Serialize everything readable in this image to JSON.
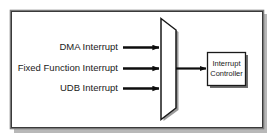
{
  "diagram": {
    "frame": {
      "border_color": "#6b6b6b",
      "inner_border_color": "#2e2e2e",
      "background_color": "#ffffff",
      "shadow_color": "#b0b0b0"
    },
    "inputs": [
      {
        "label": "DMA Interrupt",
        "y": 47
      },
      {
        "label": "Fixed Function Interrupt",
        "y": 68
      },
      {
        "label": "UDB  Interrupt",
        "y": 88
      }
    ],
    "mux": {
      "name": "interrupt-mux",
      "fill_color": "#ffffff",
      "stroke_color": "#1a1a1a",
      "shadow_color": "#8a8a8a"
    },
    "output_signal": {
      "name": "mux-output-signal",
      "color": "#0d0d0d"
    },
    "block": {
      "label_line1": "Interrupt",
      "label_line2": "Controller",
      "fill_color": "#ffffff",
      "stroke_color": "#1a1a1a",
      "shadow_color": "#6e6e6e"
    },
    "arrow_color": "#0d0d0d"
  }
}
